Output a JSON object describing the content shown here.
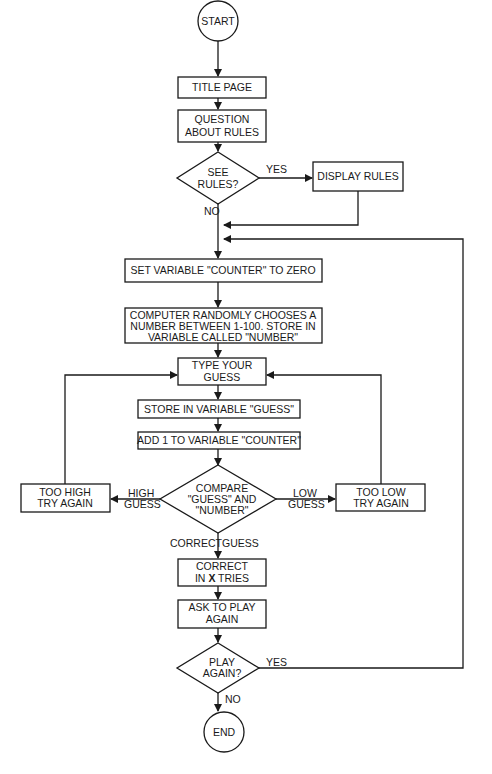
{
  "diagram": {
    "type": "flowchart",
    "colors": {
      "stroke": "#1a1a1a",
      "background": "#ffffff"
    },
    "nodes": {
      "start": {
        "shape": "terminal",
        "label": "START"
      },
      "title_page": {
        "shape": "process",
        "label": "TITLE PAGE"
      },
      "question": {
        "shape": "process",
        "lines": [
          "QUESTION",
          "ABOUT RULES"
        ]
      },
      "see_rules": {
        "shape": "decision",
        "lines": [
          "SEE",
          "RULES?"
        ]
      },
      "display_rules": {
        "shape": "process",
        "label": "DISPLAY RULES"
      },
      "set_counter": {
        "shape": "process",
        "label": "SET VARIABLE \"COUNTER\" TO ZERO"
      },
      "random_number": {
        "shape": "process",
        "lines": [
          "COMPUTER RANDOMLY CHOOSES A",
          "NUMBER BETWEEN 1-100.  STORE IN",
          "VARIABLE CALLED \"NUMBER\""
        ]
      },
      "type_guess": {
        "shape": "process",
        "lines": [
          "TYPE YOUR",
          "GUESS"
        ]
      },
      "store_guess": {
        "shape": "process",
        "label": "STORE IN VARIABLE \"GUESS\""
      },
      "add_counter": {
        "shape": "process",
        "label": "ADD 1 TO VARIABLE \"COUNTER\""
      },
      "compare": {
        "shape": "decision",
        "lines": [
          "COMPARE",
          "\"GUESS\" AND",
          "\"NUMBER\""
        ]
      },
      "too_high": {
        "shape": "process",
        "lines": [
          "TOO HIGH",
          "TRY AGAIN"
        ]
      },
      "too_low": {
        "shape": "process",
        "lines": [
          "TOO LOW",
          "TRY AGAIN"
        ]
      },
      "correct": {
        "shape": "process",
        "line1": "CORRECT",
        "line2_pre": "IN ",
        "line2_var": "X",
        "line2_post": " TRIES"
      },
      "ask_play": {
        "shape": "process",
        "lines": [
          "ASK TO PLAY",
          "AGAIN"
        ]
      },
      "play_again": {
        "shape": "decision",
        "lines": [
          "PLAY",
          "AGAIN?"
        ]
      },
      "end": {
        "shape": "terminal",
        "label": "END"
      }
    },
    "edge_labels": {
      "see_rules_yes": "YES",
      "see_rules_no": "NO",
      "high_guess": [
        "HIGH",
        "GUESS"
      ],
      "low_guess": [
        "LOW",
        "GUESS"
      ],
      "correct_guess_left": "CORRECT",
      "correct_guess_right": "GUESS",
      "play_again_yes": "YES",
      "play_again_no": "NO"
    }
  }
}
